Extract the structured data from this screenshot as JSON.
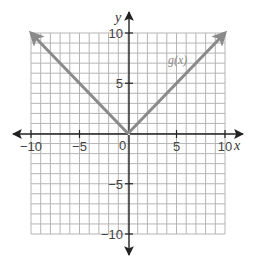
{
  "chart_data": {
    "type": "line",
    "title": "",
    "xlabel": "x",
    "ylabel": "y",
    "xlim": [
      -10,
      10
    ],
    "ylim": [
      -10,
      10
    ],
    "grid": true,
    "grid_step": 1,
    "x_ticks": [
      -10,
      -5,
      5,
      10
    ],
    "y_ticks": [
      -10,
      -5,
      5,
      10
    ],
    "x_tick_labels": [
      "−10",
      "−5",
      "5",
      "10"
    ],
    "y_tick_labels": [
      "−10",
      "−5",
      "5",
      "10"
    ],
    "origin_label": "0",
    "series": [
      {
        "name": "g(x)",
        "label": "g(x)",
        "x": [
          -10,
          0,
          10
        ],
        "y": [
          10,
          0,
          10
        ],
        "arrows_both_ends": true,
        "color": "#8a8a8a"
      }
    ],
    "legend": "inline label near upper-right branch"
  },
  "colors": {
    "background": "#ffffff",
    "grid": "#b5b5b5",
    "axis": "#222222",
    "series": "#8a8a8a"
  }
}
